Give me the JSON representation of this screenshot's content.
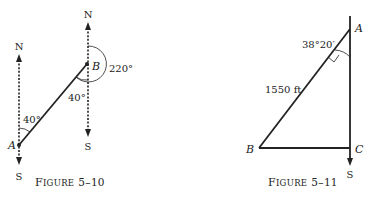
{
  "figures": [
    {
      "caption": "FIGURE 5–10",
      "caption_first": "F",
      "caption_rest": "IGURE",
      "caption_num": "5–10",
      "points": {
        "A": "A",
        "B": "B"
      },
      "compass": {
        "north": "N",
        "south": "S"
      },
      "angles": {
        "at_A": "40°",
        "at_B": "40°",
        "bearing_B": "220°"
      }
    },
    {
      "caption": "FIGURE 5–11",
      "caption_first": "F",
      "caption_rest": "IGURE",
      "caption_num": "5–11",
      "points": {
        "A": "A",
        "B": "B",
        "C": "C"
      },
      "compass": {
        "south": "S"
      },
      "angle_at_A": "38°20′",
      "side_AB": "1550 ft"
    }
  ]
}
